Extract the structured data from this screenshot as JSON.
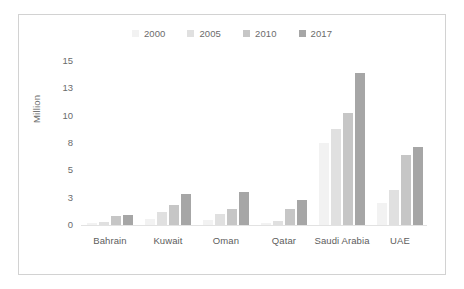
{
  "chart_data": {
    "type": "bar",
    "title": "",
    "subtitle": "",
    "xlabel": "",
    "ylabel": "Million",
    "categories": [
      "Bahrain",
      "Kuwait",
      "Oman",
      "Qatar",
      "Saudi Arabia",
      "UAE"
    ],
    "series": [
      {
        "name": "2000",
        "color": "#f2f2f2",
        "values": [
          0.15,
          0.55,
          0.45,
          0.23,
          7.5,
          2.0
        ]
      },
      {
        "name": "2005",
        "color": "#e0e0e0",
        "values": [
          0.3,
          1.2,
          1.0,
          0.4,
          8.8,
          3.2
        ]
      },
      {
        "name": "2010",
        "color": "#c6c6c6",
        "values": [
          0.8,
          1.8,
          1.5,
          1.5,
          10.2,
          6.4
        ]
      },
      {
        "name": "2017",
        "color": "#a6a6a6",
        "values": [
          0.9,
          2.8,
          3.0,
          2.3,
          13.9,
          7.1
        ]
      }
    ],
    "ytick_labels": [
      "15",
      "13",
      "10",
      "8",
      "5",
      "3",
      "0"
    ],
    "ytick_positions": [
      15,
      13,
      10,
      8,
      5,
      3,
      0
    ],
    "ylim": [
      0,
      15
    ],
    "grid": false,
    "legend_position": "top-center",
    "axis_color": "#e2e2e2",
    "tick_label_color": "#6b6b6b",
    "border_color": "#d2d2d2",
    "background": "#ffffff"
  }
}
